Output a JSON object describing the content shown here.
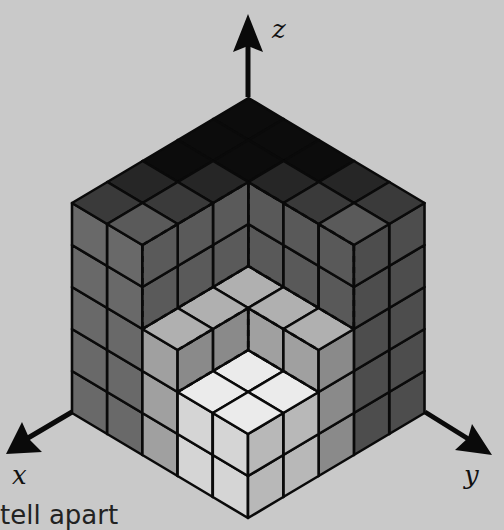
{
  "figure": {
    "grid_size": 5,
    "axes": [
      {
        "name": "x",
        "label": "x",
        "direction": "down-left"
      },
      {
        "name": "y",
        "label": "y",
        "direction": "down-right"
      },
      {
        "name": "z",
        "label": "z",
        "direction": "up"
      }
    ],
    "heightmap_note": "rows = x index (front to back), cols = y index (front to back), value = column height in unit cubes",
    "heightmap": [
      [
        2,
        2,
        3,
        5,
        5
      ],
      [
        2,
        2,
        3,
        5,
        5
      ],
      [
        3,
        3,
        3,
        5,
        5
      ],
      [
        5,
        5,
        5,
        5,
        5
      ],
      [
        5,
        5,
        5,
        5,
        5
      ]
    ],
    "colors": {
      "background": "#c9c9c9",
      "edge": "#0a0a0a",
      "front_column": "#e0e0e0",
      "inner_ring": "#a8a8a8",
      "outer_left": "#6e6e6e",
      "outer_right": "#5e5e5e",
      "top_dark": "#0c0c0c",
      "black_cell": "#050505"
    }
  },
  "caption": {
    "text": "tell apart"
  }
}
